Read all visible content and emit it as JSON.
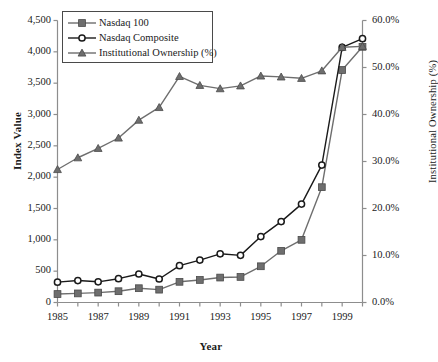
{
  "chart_data": {
    "type": "line",
    "title": "",
    "xlabel": "Year",
    "ylabel": "Index Value",
    "y2label": "Institutional Ownership (%)",
    "grid": false,
    "legend_position": "top-left",
    "x": [
      1985,
      1986,
      1987,
      1988,
      1989,
      1990,
      1991,
      1992,
      1993,
      1994,
      1995,
      1996,
      1997,
      1998,
      1999,
      2000
    ],
    "xlim": [
      1985,
      2000
    ],
    "xtick_labels": [
      "1985",
      "1987",
      "1989",
      "1991",
      "1993",
      "1995",
      "1997",
      "1999"
    ],
    "xtick_values": [
      1985,
      1987,
      1989,
      1991,
      1993,
      1995,
      1997,
      1999
    ],
    "ylim": [
      0,
      4500
    ],
    "ytick_labels": [
      "0",
      "500",
      "1,000",
      "1,500",
      "2,000",
      "2,500",
      "3,000",
      "3,500",
      "4,000",
      "4,500"
    ],
    "ytick_values": [
      0,
      500,
      1000,
      1500,
      2000,
      2500,
      3000,
      3500,
      4000,
      4500
    ],
    "y2lim": [
      0,
      60
    ],
    "y2tick_labels": [
      "0.0%",
      "10.0%",
      "20.0%",
      "30.0%",
      "40.0%",
      "50.0%",
      "60.0%"
    ],
    "y2tick_values": [
      0,
      10,
      20,
      30,
      40,
      50,
      60
    ],
    "series": [
      {
        "name": "Nasdaq 100",
        "axis": "left",
        "marker": "square",
        "color": "#6e6e6e",
        "values": [
          135,
          145,
          158,
          180,
          228,
          205,
          330,
          360,
          398,
          408,
          578,
          825,
          1000,
          1840,
          3710,
          4080
        ]
      },
      {
        "name": "Nasdaq Composite",
        "axis": "left",
        "marker": "circle-open",
        "color": "#1a1a1a",
        "values": [
          325,
          350,
          330,
          380,
          455,
          375,
          588,
          677,
          777,
          752,
          1052,
          1291,
          1570,
          2193,
          4070,
          4210
        ]
      },
      {
        "name": "Institutional Ownership (%)",
        "axis": "right",
        "marker": "triangle",
        "color": "#6e6e6e",
        "values": [
          28.3,
          30.8,
          32.8,
          35.0,
          38.8,
          41.5,
          48.1,
          46.2,
          45.5,
          46.1,
          48.2,
          48.0,
          47.7,
          49.3,
          54.3,
          54.5
        ]
      }
    ]
  },
  "legend": {
    "items": [
      {
        "label": "Nasdaq 100"
      },
      {
        "label": "Nasdaq Composite"
      },
      {
        "label": "Institutional Ownership (%)"
      }
    ]
  }
}
